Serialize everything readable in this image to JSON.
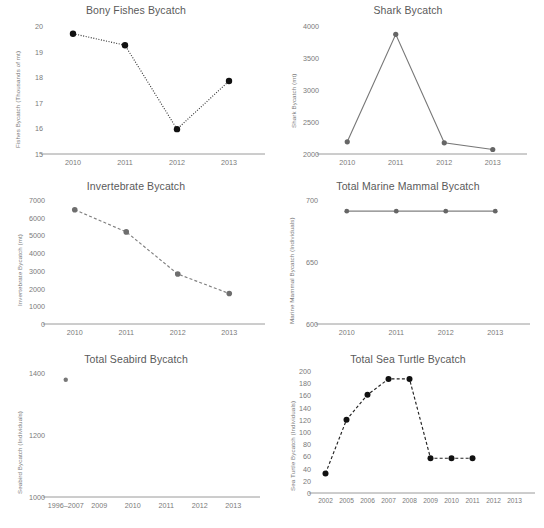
{
  "figure": {
    "background": "#ffffff",
    "text_color": "#5a5a5a",
    "tick_color": "#7a7a7a",
    "axis_color": "#9a9a9a"
  },
  "charts": [
    {
      "id": "bony-fishes-bycatch",
      "type": "line",
      "title": "Bony Fishes Bycatch",
      "xlabel": "",
      "ylabel": "Fishes Bycatch (Thousands of mt)",
      "categories": [
        "2010",
        "2011",
        "2012",
        "2013"
      ],
      "x": [
        2010,
        2011,
        2012,
        2013
      ],
      "values": [
        19.7,
        19.25,
        15.97,
        17.85
      ],
      "ylim": [
        15,
        20
      ],
      "yticks": [
        15,
        16,
        17,
        18,
        19,
        20
      ],
      "ytick_labels": [
        "15",
        "16",
        "17",
        "18",
        "19",
        "20"
      ],
      "line_style": "dotted",
      "line_color": "#333333",
      "marker_color": "#111111",
      "marker_size": 3.2,
      "grid": false,
      "legend": "none"
    },
    {
      "id": "shark-bycatch",
      "type": "line",
      "title": "Shark Bycatch",
      "xlabel": "",
      "ylabel": "Shark Bycatch (mt)",
      "categories": [
        "2010",
        "2011",
        "2012",
        "2013"
      ],
      "x": [
        2010,
        2011,
        2012,
        2013
      ],
      "values": [
        2190,
        3870,
        2175,
        2070
      ],
      "ylim": [
        2000,
        4000
      ],
      "yticks": [
        2000,
        2500,
        3000,
        3500,
        4000
      ],
      "ytick_labels": [
        "2000",
        "2500",
        "3000",
        "3500",
        "4000"
      ],
      "line_style": "solid",
      "line_color": "#777777",
      "marker_color": "#666666",
      "marker_size": 2.6,
      "grid": false,
      "legend": "none"
    },
    {
      "id": "invertebrate-bycatch",
      "type": "line",
      "title": "Invertebrate Bycatch",
      "xlabel": "",
      "ylabel": "Invertebrate Bycatch (mt)",
      "categories": [
        "2010",
        "2011",
        "2012",
        "2013"
      ],
      "x": [
        2010,
        2011,
        2012,
        2013
      ],
      "values": [
        6450,
        5200,
        2820,
        1720
      ],
      "ylim": [
        0,
        7000
      ],
      "yticks": [
        0,
        1000,
        2000,
        3000,
        4000,
        5000,
        6000,
        7000
      ],
      "ytick_labels": [
        "0",
        "1000",
        "2000",
        "3000",
        "4000",
        "5000",
        "6000",
        "7000"
      ],
      "line_style": "dashed",
      "line_color": "#808080",
      "marker_color": "#6e6e6e",
      "marker_size": 2.8,
      "grid": false,
      "legend": "none"
    },
    {
      "id": "total-marine-mammal-bycatch",
      "type": "line",
      "title": "Total Marine Mammal Bycatch",
      "xlabel": "",
      "ylabel": "Marine Mammal Bycatch (Individuals)",
      "categories": [
        "2010",
        "2011",
        "2012",
        "2013"
      ],
      "x": [
        2010,
        2011,
        2012,
        2013
      ],
      "values": [
        691,
        691,
        691,
        691
      ],
      "ylim": [
        600,
        700
      ],
      "yticks": [
        600,
        650,
        700
      ],
      "ytick_labels": [
        "600",
        "650",
        "700"
      ],
      "line_style": "solid",
      "line_color": "#808080",
      "marker_color": "#666666",
      "marker_size": 2.4,
      "grid": false,
      "legend": "none"
    },
    {
      "id": "total-seabird-bycatch",
      "type": "scatter",
      "title": "Total Seabird Bycatch",
      "xlabel": "",
      "ylabel": "Seabird Bycatch (Individuals)",
      "categories": [
        "1996–2007",
        "2009",
        "2010",
        "2011",
        "2012",
        "2013"
      ],
      "x": [
        0,
        1,
        2,
        3,
        4,
        5
      ],
      "values": [
        1378,
        null,
        null,
        null,
        null,
        null
      ],
      "ylim": [
        1000,
        1400
      ],
      "yticks": [
        1000,
        1200,
        1400
      ],
      "ytick_labels": [
        "1000",
        "1200",
        "1400"
      ],
      "line_style": "none",
      "line_color": "#999999",
      "marker_color": "#777777",
      "marker_size": 2.2,
      "grid": false,
      "legend": "none"
    },
    {
      "id": "total-sea-turtle-bycatch",
      "type": "line",
      "title": "Total Sea Turtle Bycatch",
      "xlabel": "",
      "ylabel": "Sea Turtle Bycatch (Individuals)",
      "categories": [
        "2002",
        "2005",
        "2006",
        "2007",
        "2008",
        "2009",
        "2010",
        "2011",
        "2012",
        "2013"
      ],
      "x": [
        0,
        1,
        2,
        3,
        4,
        5,
        6,
        7,
        8,
        9
      ],
      "values": [
        32,
        120,
        161,
        187,
        187,
        57,
        57,
        57,
        null,
        null
      ],
      "ylim": [
        0,
        200
      ],
      "yticks": [
        0,
        20,
        40,
        60,
        80,
        100,
        120,
        140,
        160,
        180,
        200
      ],
      "ytick_labels": [
        "0",
        "20",
        "40",
        "60",
        "80",
        "100",
        "120",
        "140",
        "160",
        "180",
        "200"
      ],
      "line_style": "dashed",
      "line_color": "#222222",
      "marker_color": "#111111",
      "marker_size": 3.0,
      "grid": false,
      "legend": "none"
    }
  ],
  "chart_data": [
    {
      "type": "line",
      "title": "Bony Fishes Bycatch",
      "xlabel": "",
      "ylabel": "Fishes Bycatch (Thousands of mt)",
      "categories": [
        "2010",
        "2011",
        "2012",
        "2013"
      ],
      "values": [
        19.7,
        19.25,
        15.97,
        17.85
      ],
      "ylim": [
        15,
        20
      ],
      "grid": false,
      "legend": "none"
    },
    {
      "type": "line",
      "title": "Shark Bycatch",
      "xlabel": "",
      "ylabel": "Shark Bycatch (mt)",
      "categories": [
        "2010",
        "2011",
        "2012",
        "2013"
      ],
      "values": [
        2190,
        3870,
        2175,
        2070
      ],
      "ylim": [
        2000,
        4000
      ],
      "grid": false,
      "legend": "none"
    },
    {
      "type": "line",
      "title": "Invertebrate Bycatch",
      "xlabel": "",
      "ylabel": "Invertebrate Bycatch (mt)",
      "categories": [
        "2010",
        "2011",
        "2012",
        "2013"
      ],
      "values": [
        6450,
        5200,
        2820,
        1720
      ],
      "ylim": [
        0,
        7000
      ],
      "grid": false,
      "legend": "none"
    },
    {
      "type": "line",
      "title": "Total Marine Mammal Bycatch",
      "xlabel": "",
      "ylabel": "Marine Mammal Bycatch (Individuals)",
      "categories": [
        "2010",
        "2011",
        "2012",
        "2013"
      ],
      "values": [
        691,
        691,
        691,
        691
      ],
      "ylim": [
        600,
        700
      ],
      "grid": false,
      "legend": "none"
    },
    {
      "type": "scatter",
      "title": "Total Seabird Bycatch",
      "xlabel": "",
      "ylabel": "Seabird Bycatch (Individuals)",
      "categories": [
        "1996–2007",
        "2009",
        "2010",
        "2011",
        "2012",
        "2013"
      ],
      "values": [
        1378,
        null,
        null,
        null,
        null,
        null
      ],
      "ylim": [
        1000,
        1400
      ],
      "grid": false,
      "legend": "none"
    },
    {
      "type": "line",
      "title": "Total Sea Turtle Bycatch",
      "xlabel": "",
      "ylabel": "Sea Turtle Bycatch (Individuals)",
      "categories": [
        "2002",
        "2005",
        "2006",
        "2007",
        "2008",
        "2009",
        "2010",
        "2011",
        "2012",
        "2013"
      ],
      "values": [
        32,
        120,
        161,
        187,
        187,
        57,
        57,
        57,
        null,
        null
      ],
      "ylim": [
        0,
        200
      ],
      "grid": false,
      "legend": "none"
    }
  ]
}
